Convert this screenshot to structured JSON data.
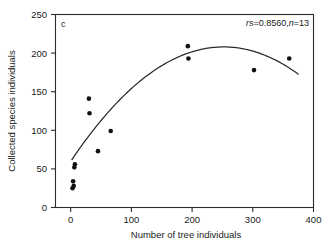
{
  "chart_data": {
    "type": "scatter",
    "title": "",
    "panel_label": "c",
    "xlabel": "Number of tree individuals",
    "ylabel": "Collected species individuals",
    "xlim": [
      -25,
      400
    ],
    "ylim": [
      0,
      250
    ],
    "xticks": [
      0,
      100,
      200,
      300,
      400
    ],
    "xticklabels": [
      "0",
      "100",
      "200",
      "300",
      "400"
    ],
    "yticks": [
      0,
      50,
      100,
      150,
      200,
      250
    ],
    "yticklabels": [
      "0",
      "50",
      "100",
      "150",
      "200",
      "250"
    ],
    "grid": false,
    "legend": null,
    "annotations": [
      {
        "name": "correlation-stats",
        "text": "rs=0.8560,n=13",
        "parts": [
          {
            "text": "r",
            "style": "italic"
          },
          {
            "text": "s",
            "style": "italic"
          },
          {
            "text": "=0.8560,",
            "style": "normal"
          },
          {
            "text": "n",
            "style": "italic"
          },
          {
            "text": "=13",
            "style": "normal"
          }
        ],
        "position": "top-right"
      }
    ],
    "statistics": {
      "spearman_rs": 0.856,
      "n": 13
    },
    "points": [
      {
        "x": 3,
        "y": 25
      },
      {
        "x": 5,
        "y": 28
      },
      {
        "x": 4,
        "y": 34
      },
      {
        "x": 6,
        "y": 52
      },
      {
        "x": 7,
        "y": 56
      },
      {
        "x": 30,
        "y": 141
      },
      {
        "x": 31,
        "y": 122
      },
      {
        "x": 45,
        "y": 73
      },
      {
        "x": 66,
        "y": 99
      },
      {
        "x": 193,
        "y": 209
      },
      {
        "x": 194,
        "y": 193
      },
      {
        "x": 302,
        "y": 178
      },
      {
        "x": 360,
        "y": 193
      }
    ],
    "fit_curve": {
      "name": "quadratic-fit",
      "description": "fitted quadratic regression curve",
      "x_start": 2,
      "x_end": 375,
      "vertex_x": 252,
      "vertex_y": 208,
      "y_at_x_start": 44,
      "y_at_x_end": 177
    },
    "marker": {
      "shape": "circle",
      "color": "#111111",
      "size": 4.6
    },
    "line_color": "#2b2b2b"
  },
  "colors": {
    "background": "#ffffff",
    "axis": "#2b2b2b",
    "text": "#1a1a1a",
    "marker": "#111111"
  }
}
